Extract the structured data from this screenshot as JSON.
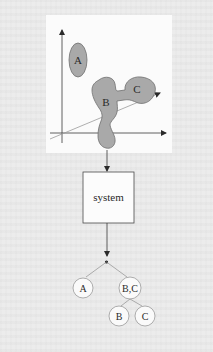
{
  "figure": {
    "scatter_plot": {
      "clusters": [
        {
          "id": "A",
          "label": "A"
        },
        {
          "id": "B",
          "label": "B"
        },
        {
          "id": "C",
          "label": "C"
        }
      ]
    },
    "system_box": {
      "label": "system"
    },
    "tree": {
      "root": {
        "label": ""
      },
      "children": [
        {
          "label": "A"
        },
        {
          "label": "B,C",
          "children": [
            {
              "label": "B"
            },
            {
              "label": "C"
            }
          ]
        }
      ]
    },
    "colors": {
      "cluster_fill": "#a9a9a9",
      "cluster_stroke": "#6e6e6e",
      "line": "#3a3a3a",
      "node_fill": "#fafafa",
      "node_stroke": "#9a9a9a",
      "background": "#ececec",
      "panel": "#fbfbfb"
    }
  }
}
